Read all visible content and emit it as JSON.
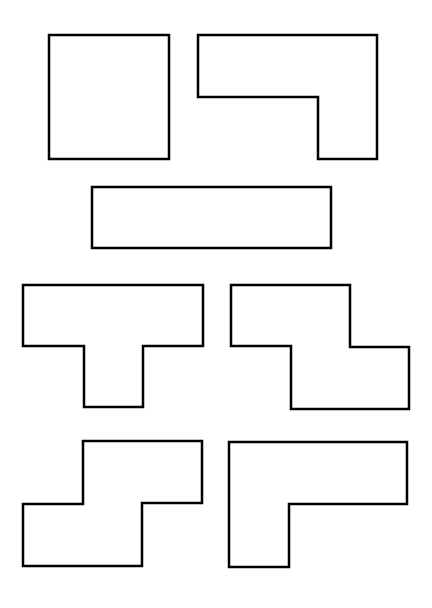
{
  "diagram": {
    "width": 432,
    "height": 608,
    "background": "#ffffff",
    "stroke_color": "#000000",
    "fill_color": "#ffffff",
    "stroke_width": 2.5,
    "shapes": [
      {
        "name": "square",
        "points": "49,35 169,35 169,159 49,159"
      },
      {
        "name": "l-shape-top",
        "points": "198,35 377,35 377,159 318,159 318,97 198,97"
      },
      {
        "name": "long-rectangle",
        "points": "92,187 331,187 331,248 92,248"
      },
      {
        "name": "t-shape",
        "points": "23,285 203,285 203,346 143,346 143,407 84,407 84,346 23,346"
      },
      {
        "name": "z-shape",
        "points": "231,285 350,285 350,347 409,347 409,409 291,409 291,346 231,346"
      },
      {
        "name": "s-shape",
        "points": "83,441 202,441 202,503 142,503 142,566 23,566 23,504 83,504"
      },
      {
        "name": "l-shape-bottom",
        "points": "229,442 407,442 407,504 289,504 289,567 229,567"
      }
    ]
  }
}
